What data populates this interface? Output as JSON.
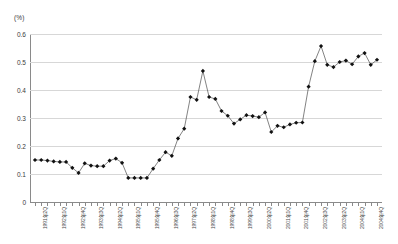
{
  "chart_data": {
    "type": "line",
    "title": "",
    "subtitle": "",
    "unit_label": "(%)",
    "xlabel": "",
    "ylabel": "",
    "ylim": [
      0,
      0.6
    ],
    "yticks": [
      "0",
      "0.1",
      "0.2",
      "0.3",
      "0.4",
      "0.5",
      "0.6"
    ],
    "ytick_values": [
      0,
      0.1,
      0.2,
      0.3,
      0.4,
      0.5,
      0.6
    ],
    "grid": true,
    "legend": "none",
    "marker": "diamond",
    "series": [
      {
        "name": "",
        "values": [
          0.15,
          0.15,
          0.148,
          0.145,
          0.143,
          0.143,
          0.122,
          0.104,
          0.138,
          0.13,
          0.128,
          0.128,
          0.148,
          0.155,
          0.14,
          0.086,
          0.086,
          0.086,
          0.086,
          0.119,
          0.15,
          0.178,
          0.165,
          0.227,
          0.262,
          0.375,
          0.365,
          0.468,
          0.375,
          0.368,
          0.325,
          0.308,
          0.28,
          0.295,
          0.31,
          0.307,
          0.303,
          0.32,
          0.25,
          0.272,
          0.267,
          0.277,
          0.283,
          0.284,
          0.412,
          0.503,
          0.557,
          0.49,
          0.482,
          0.5,
          0.505,
          0.492,
          0.52,
          0.532,
          0.49,
          0.508
        ]
      }
    ],
    "categories": [
      "1991年1Q",
      "1991年2Q",
      "1991年3Q",
      "1991年4Q",
      "1992年1Q",
      "1992年2Q",
      "1992年3Q",
      "1992年4Q",
      "1993年1Q",
      "1993年2Q",
      "1993年3Q",
      "1993年4Q",
      "1994年1Q",
      "1994年2Q",
      "1994年3Q",
      "1994年4Q",
      "1995年1Q",
      "1995年2Q",
      "1995年3Q",
      "1995年4Q",
      "1996年1Q",
      "1996年2Q",
      "1996年3Q",
      "1996年4Q",
      "1997年1Q",
      "1997年2Q",
      "1997年3Q",
      "1997年4Q",
      "1998年1Q",
      "1998年2Q",
      "1998年3Q",
      "1998年4Q",
      "1999年1Q",
      "1999年2Q",
      "1999年3Q",
      "1999年4Q",
      "2000年1Q",
      "2000年2Q",
      "2000年3Q",
      "2000年4Q",
      "2001年1Q",
      "2001年2Q",
      "2001年3Q",
      "2001年4Q",
      "2002年1Q",
      "2002年2Q",
      "2002年3Q",
      "2002年4Q",
      "2003年1Q",
      "2003年2Q",
      "2003年3Q",
      "2003年4Q",
      "2004年1Q",
      "2004年2Q",
      "2004年3Q",
      "2004年4Q"
    ],
    "visible_xtick_labels": [
      {
        "index": 1,
        "text": "1991年2Q"
      },
      {
        "index": 4,
        "text": "1992年1Q"
      },
      {
        "index": 7,
        "text": "1992年4Q"
      },
      {
        "index": 10,
        "text": "1993年3Q"
      },
      {
        "index": 13,
        "text": "1994年2Q"
      },
      {
        "index": 16,
        "text": "1995年1Q"
      },
      {
        "index": 19,
        "text": "1995年4Q"
      },
      {
        "index": 22,
        "text": "1996年3Q"
      },
      {
        "index": 25,
        "text": "1997年2Q"
      },
      {
        "index": 28,
        "text": "1998年1Q"
      },
      {
        "index": 31,
        "text": "1998年4Q"
      },
      {
        "index": 34,
        "text": "1999年3Q"
      },
      {
        "index": 37,
        "text": "2000年2Q"
      },
      {
        "index": 40,
        "text": "2001年1Q"
      },
      {
        "index": 43,
        "text": "2001年4Q"
      },
      {
        "index": 46,
        "text": "2002年3Q"
      },
      {
        "index": 49,
        "text": "2003年2Q"
      },
      {
        "index": 52,
        "text": "2004年1Q"
      },
      {
        "index": 55,
        "text": "2004年4Q"
      }
    ],
    "colors": {
      "line": "#4d4d4d",
      "marker": "#111111",
      "grid": "#d7d7d7",
      "axis": "#8a8a8a",
      "text": "#3a3a3a",
      "background": "#ffffff"
    }
  },
  "caption": {
    "text": ""
  }
}
